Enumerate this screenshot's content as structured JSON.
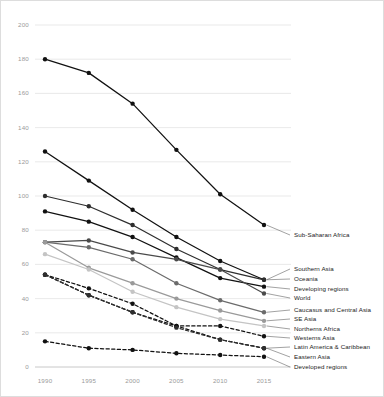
{
  "chart_data": {
    "type": "line",
    "title": "",
    "subtitle": "",
    "xlabel": "",
    "ylabel": "",
    "x": [
      1990,
      1995,
      2000,
      2005,
      2010,
      2015
    ],
    "xtick_labels": [
      "1990",
      "1995",
      "2000",
      "2005",
      "2010",
      "2015"
    ],
    "ytick_labels": [
      "0",
      "20",
      "40",
      "60",
      "80",
      "100",
      "120",
      "140",
      "160",
      "180",
      "200"
    ],
    "yticks": [
      0,
      20,
      40,
      60,
      80,
      100,
      120,
      140,
      160,
      180,
      200
    ],
    "ylim": [
      0,
      200
    ],
    "xlim": [
      1990,
      2015
    ],
    "grid": "horizontal",
    "legend_position": "right-inline-labels",
    "series": [
      {
        "name": "Sub-Saharan Africa",
        "values": [
          180,
          172,
          154,
          127,
          101,
          83
        ],
        "color": "#111111",
        "style": "solid"
      },
      {
        "name": "Southern Asia",
        "values": [
          126,
          109,
          92,
          76,
          62,
          51
        ],
        "color": "#111111",
        "style": "solid"
      },
      {
        "name": "Oceania",
        "values": [
          100,
          94,
          83,
          69,
          57,
          51
        ],
        "color": "#2e2e2e",
        "style": "solid"
      },
      {
        "name": "Developing regions",
        "values": [
          91,
          85,
          76,
          64,
          52,
          47
        ],
        "color": "#111111",
        "style": "solid"
      },
      {
        "name": "World",
        "values": [
          73,
          74,
          67,
          63,
          57,
          43
        ],
        "color": "#4a4a4a",
        "style": "solid"
      },
      {
        "name": "Caucasus and Central Asia",
        "values": [
          73,
          70,
          63,
          49,
          39,
          32
        ],
        "color": "#6b6b6b",
        "style": "solid"
      },
      {
        "name": "SE Asia",
        "values": [
          73,
          58,
          49,
          40,
          33,
          27
        ],
        "color": "#9a9a9a",
        "style": "solid"
      },
      {
        "name": "Northerns Africa",
        "values": [
          66,
          57,
          44,
          35,
          28,
          24
        ],
        "color": "#c4c4c4",
        "style": "solid"
      },
      {
        "name": "Westerns Asia",
        "values": [
          54,
          46,
          37,
          24,
          24,
          18
        ],
        "color": "#111111",
        "style": "dashed"
      },
      {
        "name": "Latin America & Caribbean",
        "values": [
          54,
          42,
          32,
          24,
          16,
          11
        ],
        "color": "#111111",
        "style": "dashed"
      },
      {
        "name": "Eastern Asia",
        "values": [
          54,
          42,
          32,
          23,
          16,
          11
        ],
        "color": "#2e2e2e",
        "style": "dashed"
      },
      {
        "name": "Developed regions",
        "values": [
          15,
          11,
          10,
          8,
          7,
          6
        ],
        "color": "#111111",
        "style": "dashed"
      }
    ],
    "inline_labels": [
      {
        "name": "Sub-Saharan Africa",
        "y_px": 234
      },
      {
        "name": "Southern Asia",
        "y_px": 268
      },
      {
        "name": "Oceania",
        "y_px": 278
      },
      {
        "name": "Developing regions",
        "y_px": 288
      },
      {
        "name": "World",
        "y_px": 297
      },
      {
        "name": "Caucasus and Central Asia",
        "y_px": 309
      },
      {
        "name": "SE Asia",
        "y_px": 318
      },
      {
        "name": "Northerns Africa",
        "y_px": 328
      },
      {
        "name": "Westerns Asia",
        "y_px": 337
      },
      {
        "name": "Latin America & Caribbean",
        "y_px": 346
      },
      {
        "name": "Eastern Asia",
        "y_px": 356
      },
      {
        "name": "Developed regions",
        "y_px": 366
      }
    ],
    "colors": {
      "grid": "#e3e3e3",
      "tick_text": "#9a9a9a",
      "label_text": "#1a1a1a",
      "background": "#ffffff",
      "border": "#dddddd"
    }
  }
}
